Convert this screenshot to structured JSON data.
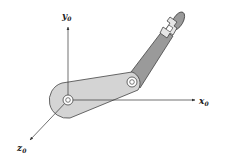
{
  "diagram": {
    "type": "two-link planar robot arm with coordinate frame",
    "axes": {
      "x": {
        "label": "x",
        "subscript": "0"
      },
      "y": {
        "label": "y",
        "subscript": "0"
      },
      "z": {
        "label": "z",
        "subscript": "0"
      }
    },
    "colors": {
      "link1_fill": "#d4d4d4",
      "link2_fill": "#9a9a9a",
      "stroke": "#444444",
      "gripper_fill": "#e6e6e6",
      "axis": "#333333"
    },
    "components": [
      "base-joint",
      "link-1",
      "elbow-joint",
      "link-2",
      "gripper"
    ]
  }
}
